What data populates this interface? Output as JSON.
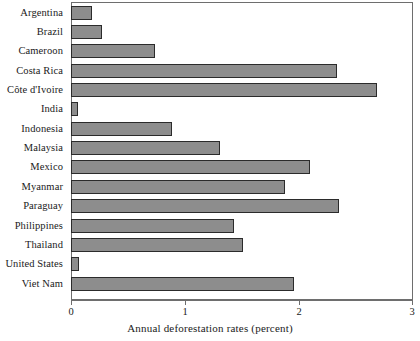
{
  "chart_data": {
    "type": "bar",
    "orientation": "horizontal",
    "title": "",
    "xlabel": "Annual deforestation rates (percent)",
    "ylabel": "",
    "xlim": [
      0,
      3
    ],
    "xticks": [
      0,
      1,
      2,
      3
    ],
    "xtick_labels": [
      "0",
      "1",
      "2",
      "3"
    ],
    "grid": false,
    "legend": null,
    "bar_fill_color": "#8d8d8d",
    "bar_edge_color": "#2b2b2b",
    "axis_color": "#6e6e6e",
    "categories": [
      "Argentina",
      "Brazil",
      "Cameroon",
      "Costa Rica",
      "Côte d'Ivoire",
      "India",
      "Indonesia",
      "Malaysia",
      "Mexico",
      "Myanmar",
      "Paraguay",
      "Philippines",
      "Thailand",
      "United States",
      "Viet Nam"
    ],
    "values": [
      0.18,
      0.27,
      0.74,
      2.33,
      2.68,
      0.06,
      0.89,
      1.31,
      2.1,
      1.88,
      2.35,
      1.43,
      1.51,
      0.07,
      1.96
    ]
  }
}
